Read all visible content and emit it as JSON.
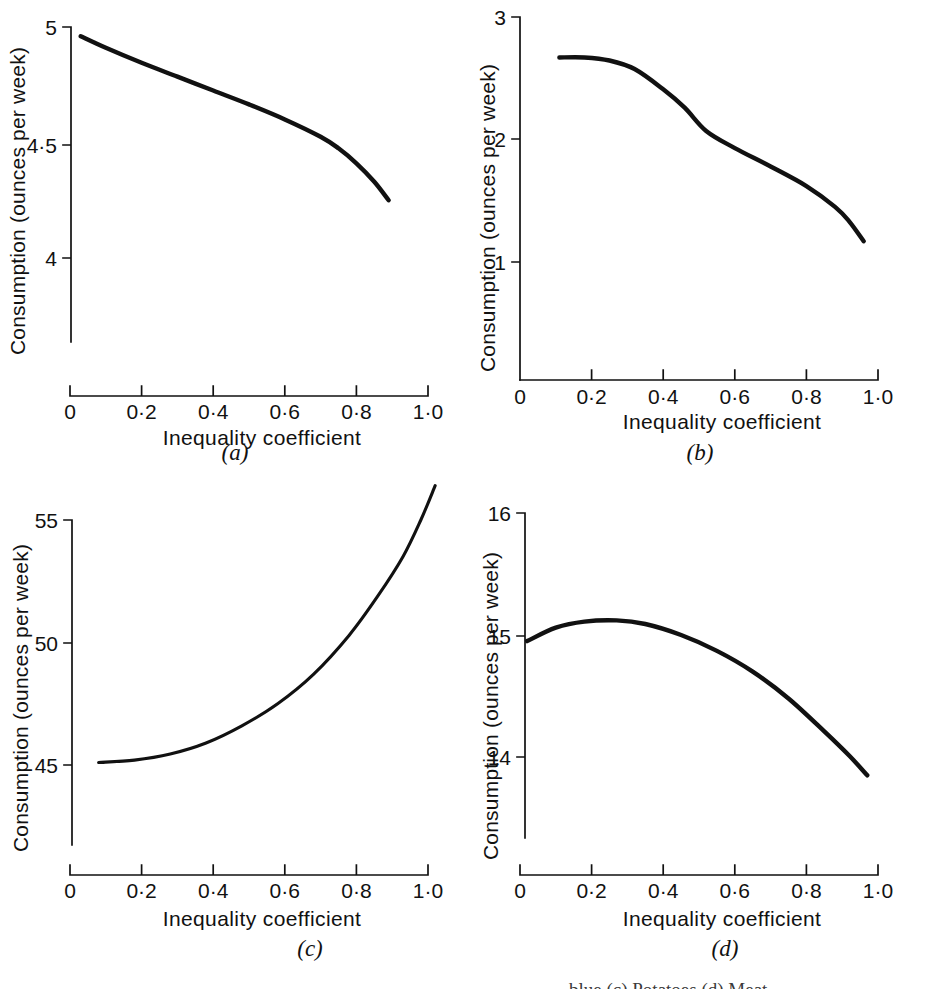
{
  "figure": {
    "y_axis_label": "Consumption (ounces per week)",
    "x_axis_label": "Inequality coefficient",
    "bottom_caption": "…blue (c) Potatoes (d) Meat"
  },
  "panels": [
    {
      "id": "a",
      "caption": "(a)",
      "y_ticks": [
        "5",
        "4·5",
        "4"
      ],
      "x_ticks": [
        "0",
        "0·2",
        "0·4",
        "0·6",
        "0·8",
        "1·0"
      ],
      "y_axis_label": "Consumption (ounces per week)",
      "x_axis_label": "Inequality coefficient"
    },
    {
      "id": "b",
      "caption": "(b)",
      "y_ticks": [
        "3",
        "2",
        "1"
      ],
      "x_ticks": [
        "0",
        "0·2",
        "0·4",
        "0·6",
        "0·8",
        "1·0"
      ],
      "y_axis_label": "Consumption (ounces per week)",
      "x_axis_label": "Inequality coefficient"
    },
    {
      "id": "c",
      "caption": "(c)",
      "y_ticks": [
        "55",
        "50",
        "45"
      ],
      "x_ticks": [
        "0",
        "0·2",
        "0·4",
        "0·6",
        "0·8",
        "1·0"
      ],
      "y_axis_label": "Consumption (ounces per week)",
      "x_axis_label": "Inequality coefficient"
    },
    {
      "id": "d",
      "caption": "(d)",
      "y_ticks": [
        "16",
        "15",
        "14"
      ],
      "x_ticks": [
        "0",
        "0·2",
        "0·4",
        "0·6",
        "0·8",
        "1·0"
      ],
      "y_axis_label": "Consumption (ounces per week)",
      "x_axis_label": "Inequality coefficient"
    }
  ],
  "chart_data": [
    {
      "type": "line",
      "panel": "a",
      "title": "(a)",
      "xlabel": "Inequality coefficient",
      "ylabel": "Consumption (ounces per week)",
      "xlim": [
        0,
        1.0
      ],
      "ylim": [
        3.72,
        5.0
      ],
      "xticks": [
        0,
        0.2,
        0.4,
        0.6,
        0.8,
        1.0
      ],
      "xticklabels": [
        "0",
        "0·2",
        "0·4",
        "0·6",
        "0·8",
        "1·0"
      ],
      "yticks": [
        4,
        4.5,
        5
      ],
      "yticklabels": [
        "4",
        "4·5",
        "5"
      ],
      "grid": false,
      "legend": null,
      "x": [
        0.03,
        0.1,
        0.2,
        0.3,
        0.4,
        0.5,
        0.6,
        0.7,
        0.75,
        0.8,
        0.85,
        0.89
      ],
      "values": [
        4.96,
        4.91,
        4.845,
        4.785,
        4.725,
        4.665,
        4.6,
        4.525,
        4.475,
        4.41,
        4.33,
        4.25
      ]
    },
    {
      "type": "line",
      "panel": "b",
      "title": "(b)",
      "xlabel": "Inequality coefficient",
      "ylabel": "Consumption (ounces per week)",
      "xlim": [
        0,
        1.0
      ],
      "ylim": [
        -0.1,
        3.0
      ],
      "xticks": [
        0,
        0.2,
        0.4,
        0.6,
        0.8,
        1.0
      ],
      "xticklabels": [
        "0",
        "0·2",
        "0·4",
        "0·6",
        "0·8",
        "1·0"
      ],
      "yticks": [
        1,
        2,
        3
      ],
      "yticklabels": [
        "1",
        "2",
        "3"
      ],
      "grid": false,
      "legend": null,
      "x": [
        0.11,
        0.18,
        0.25,
        0.32,
        0.4,
        0.46,
        0.52,
        0.6,
        0.7,
        0.8,
        0.88,
        0.92,
        0.96
      ],
      "values": [
        2.67,
        2.67,
        2.645,
        2.575,
        2.41,
        2.26,
        2.07,
        1.93,
        1.78,
        1.62,
        1.45,
        1.33,
        1.17
      ]
    },
    {
      "type": "line",
      "panel": "c",
      "title": "(c)",
      "xlabel": "Inequality coefficient",
      "ylabel": "Consumption (ounces per week)",
      "xlim": [
        0,
        1.0
      ],
      "ylim": [
        41.7,
        56.5
      ],
      "xticks": [
        0,
        0.2,
        0.4,
        0.6,
        0.8,
        1.0
      ],
      "xticklabels": [
        "0",
        "0·2",
        "0·4",
        "0·6",
        "0·8",
        "1·0"
      ],
      "yticks": [
        45,
        50,
        55
      ],
      "yticklabels": [
        "45",
        "50",
        "55"
      ],
      "grid": false,
      "legend": null,
      "x": [
        0.08,
        0.18,
        0.28,
        0.38,
        0.48,
        0.58,
        0.68,
        0.78,
        0.86,
        0.93,
        0.98,
        1.02
      ],
      "values": [
        45.1,
        45.2,
        45.45,
        45.9,
        46.6,
        47.5,
        48.7,
        50.3,
        51.9,
        53.5,
        55.0,
        56.4
      ]
    },
    {
      "type": "line",
      "panel": "d",
      "title": "(d)",
      "xlabel": "Inequality coefficient",
      "ylabel": "Consumption (ounces per week)",
      "xlim": [
        0,
        1.0
      ],
      "ylim": [
        13.0,
        16.0
      ],
      "xticks": [
        0,
        0.2,
        0.4,
        0.6,
        0.8,
        1.0
      ],
      "xticklabels": [
        "0",
        "0·2",
        "0·4",
        "0·6",
        "0·8",
        "1·0"
      ],
      "yticks": [
        14,
        15,
        16
      ],
      "yticklabels": [
        "14",
        "15",
        "16"
      ],
      "grid": false,
      "legend": null,
      "x": [
        0.02,
        0.1,
        0.18,
        0.27,
        0.35,
        0.45,
        0.55,
        0.65,
        0.75,
        0.85,
        0.92,
        0.97
      ],
      "values": [
        14.95,
        15.06,
        15.11,
        15.12,
        15.09,
        15.0,
        14.87,
        14.7,
        14.48,
        14.21,
        14.01,
        13.85
      ]
    }
  ]
}
